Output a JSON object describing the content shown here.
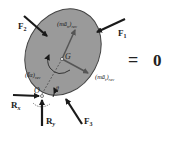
{
  "diagram": {
    "body_fill": "#9a9a9a",
    "body_stroke": "#444444",
    "arrow_color": "#1a1a1a",
    "inertial_arrow_color": "#5a5a5a",
    "labels": {
      "F1": "F",
      "F1_sub": "1",
      "F2": "F",
      "F2_sub": "2",
      "F3": "F",
      "F3_sub": "3",
      "Rx": "R",
      "Rx_sub": "x",
      "Ry": "R",
      "Ry_sub": "y",
      "G": "G",
      "O": "O",
      "theta": "θ",
      "man_main": "(mā",
      "man_sub": "n",
      "man_close": ")",
      "man_rev": "rev",
      "mat_main": "(mā",
      "mat_sub": "t",
      "mat_close": ")",
      "mat_rev": "rev",
      "ia_main": "(Īα)",
      "ia_rev": "rev"
    },
    "equation": {
      "equals": "=",
      "zero": "0"
    }
  }
}
